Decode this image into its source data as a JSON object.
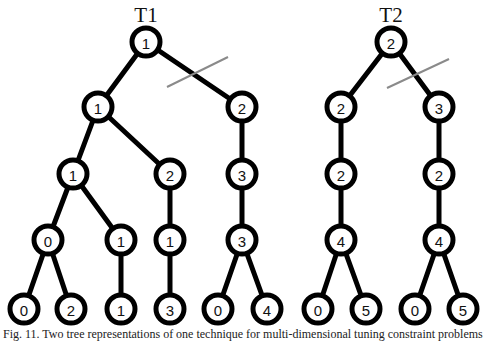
{
  "figure": {
    "trees": [
      {
        "title": "T1",
        "title_pos": [
          146,
          16
        ],
        "nodes": [
          {
            "id": "a",
            "label": "1",
            "x": 146,
            "y": 42
          },
          {
            "id": "b",
            "label": "1",
            "x": 98,
            "y": 107
          },
          {
            "id": "c",
            "label": "2",
            "x": 242,
            "y": 107
          },
          {
            "id": "d",
            "label": "1",
            "x": 73,
            "y": 174
          },
          {
            "id": "e",
            "label": "2",
            "x": 170,
            "y": 174
          },
          {
            "id": "f",
            "label": "3",
            "x": 242,
            "y": 174
          },
          {
            "id": "g",
            "label": "0",
            "x": 48,
            "y": 240
          },
          {
            "id": "h",
            "label": "1",
            "x": 121,
            "y": 240
          },
          {
            "id": "i",
            "label": "1",
            "x": 170,
            "y": 240
          },
          {
            "id": "j",
            "label": "3",
            "x": 242,
            "y": 240
          },
          {
            "id": "k",
            "label": "0",
            "x": 24,
            "y": 309
          },
          {
            "id": "l",
            "label": "2",
            "x": 71,
            "y": 309
          },
          {
            "id": "m",
            "label": "1",
            "x": 121,
            "y": 309
          },
          {
            "id": "n",
            "label": "3",
            "x": 170,
            "y": 309
          },
          {
            "id": "o",
            "label": "0",
            "x": 218,
            "y": 309
          },
          {
            "id": "p",
            "label": "4",
            "x": 267,
            "y": 309
          }
        ],
        "edges": [
          [
            "a",
            "b"
          ],
          [
            "a",
            "c"
          ],
          [
            "b",
            "d"
          ],
          [
            "b",
            "e"
          ],
          [
            "c",
            "f"
          ],
          [
            "d",
            "g"
          ],
          [
            "d",
            "h"
          ],
          [
            "e",
            "i"
          ],
          [
            "f",
            "j"
          ],
          [
            "g",
            "k"
          ],
          [
            "g",
            "l"
          ],
          [
            "h",
            "m"
          ],
          [
            "i",
            "n"
          ],
          [
            "j",
            "o"
          ],
          [
            "j",
            "p"
          ]
        ],
        "cut_mark": [
          167,
          87,
          228,
          57
        ]
      },
      {
        "title": "T2",
        "title_pos": [
          391,
          16
        ],
        "nodes": [
          {
            "id": "a",
            "label": "2",
            "x": 391,
            "y": 42
          },
          {
            "id": "b",
            "label": "2",
            "x": 341,
            "y": 107
          },
          {
            "id": "c",
            "label": "3",
            "x": 439,
            "y": 107
          },
          {
            "id": "d",
            "label": "2",
            "x": 341,
            "y": 174
          },
          {
            "id": "e",
            "label": "2",
            "x": 439,
            "y": 174
          },
          {
            "id": "f",
            "label": "4",
            "x": 341,
            "y": 240
          },
          {
            "id": "g",
            "label": "4",
            "x": 439,
            "y": 240
          },
          {
            "id": "h",
            "label": "0",
            "x": 318,
            "y": 309
          },
          {
            "id": "i",
            "label": "5",
            "x": 366,
            "y": 309
          },
          {
            "id": "j",
            "label": "0",
            "x": 415,
            "y": 309
          },
          {
            "id": "k",
            "label": "5",
            "x": 463,
            "y": 309
          }
        ],
        "edges": [
          [
            "a",
            "b"
          ],
          [
            "a",
            "c"
          ],
          [
            "b",
            "d"
          ],
          [
            "c",
            "e"
          ],
          [
            "d",
            "f"
          ],
          [
            "e",
            "g"
          ],
          [
            "f",
            "h"
          ],
          [
            "f",
            "i"
          ],
          [
            "g",
            "j"
          ],
          [
            "g",
            "k"
          ]
        ],
        "cut_mark": [
          387,
          88,
          449,
          59
        ]
      }
    ],
    "caption": "Fig. 11. Two tree representations of one technique for multi-dimensional tuning constraint problems"
  }
}
